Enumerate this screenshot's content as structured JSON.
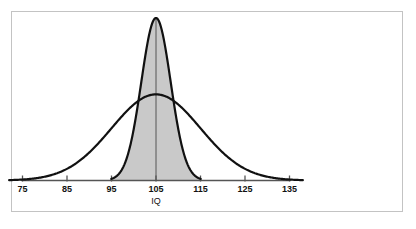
{
  "figure": {
    "background_color": "#ffffff",
    "border_color": "#c3c3c3",
    "curve_color": "#111111",
    "fill_color": "#c9c9c9",
    "axis_color": "#555555"
  },
  "chart_data": {
    "type": "line",
    "title": "",
    "subtitle": "",
    "xlabel": "IQ",
    "ylabel": "",
    "xlim": [
      72,
      138
    ],
    "ylim": [
      0,
      1.08
    ],
    "grid": false,
    "legend": "none",
    "xticks": [
      75,
      85,
      95,
      105,
      115,
      125,
      135
    ],
    "xtick_labels": [
      "75",
      "85",
      "95",
      "105",
      "115",
      "125",
      "135"
    ],
    "center_line_at": 105,
    "series": [
      {
        "name": "narrow-distribution",
        "kind": "normal",
        "mean": 105,
        "sigma": 3.3,
        "peak_height": 1.0,
        "filled": true,
        "fill_color": "#c9c9c9",
        "stroke_color": "#111111",
        "stroke_width": 2.2,
        "x": [
          95,
          97,
          99,
          101,
          103,
          105,
          107,
          109,
          111,
          113,
          115
        ],
        "values": [
          0.01,
          0.07,
          0.23,
          0.55,
          0.88,
          1.0,
          0.88,
          0.55,
          0.23,
          0.07,
          0.01
        ]
      },
      {
        "name": "wide-distribution",
        "kind": "normal",
        "mean": 105,
        "sigma": 10.0,
        "peak_height": 0.53,
        "filled": false,
        "stroke_color": "#111111",
        "stroke_width": 2.2,
        "x": [
          75,
          80,
          85,
          90,
          95,
          100,
          105,
          110,
          115,
          120,
          125,
          130,
          135
        ],
        "values": [
          0.006,
          0.029,
          0.094,
          0.213,
          0.35,
          0.477,
          0.53,
          0.477,
          0.35,
          0.213,
          0.094,
          0.029,
          0.006
        ]
      }
    ],
    "annotations": []
  }
}
